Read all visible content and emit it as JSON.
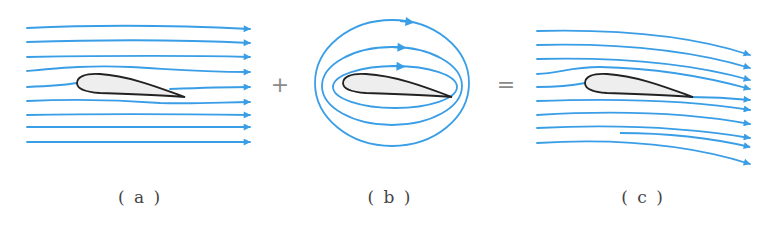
{
  "figure": {
    "colors": {
      "streamline": "#3a9ee6",
      "airfoil_outline": "#222222",
      "airfoil_fill": "#eeeeee",
      "label_text": "#444444",
      "operator_text": "#8a8a8a"
    },
    "operators": {
      "plus": "+",
      "equals": "="
    },
    "panels": [
      {
        "id": "a",
        "label": "( a )",
        "content": "Uniform flow streamlines past airfoil",
        "streamline_count": 9
      },
      {
        "id": "b",
        "label": "( b )",
        "content": "Circulation streamlines around airfoil",
        "streamline_count": 3
      },
      {
        "id": "c",
        "label": "( c )",
        "content": "Combined flow: uniform flow plus circulation",
        "streamline_count": 9
      }
    ]
  }
}
